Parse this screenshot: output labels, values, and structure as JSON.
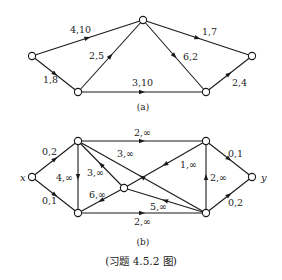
{
  "figure_a": {
    "caption": "(a)",
    "nodes": [
      {
        "id": "a1",
        "x": 32,
        "y": 56
      },
      {
        "id": "a2",
        "x": 78,
        "y": 92
      },
      {
        "id": "a3",
        "x": 143,
        "y": 20
      },
      {
        "id": "a4",
        "x": 206,
        "y": 92
      },
      {
        "id": "a5",
        "x": 252,
        "y": 56
      }
    ],
    "edges": [
      {
        "from": "a1",
        "to": "a3",
        "label": "4,10",
        "lx": 70,
        "ly": 33
      },
      {
        "from": "a1",
        "to": "a2",
        "label": "1,8",
        "lx": 43,
        "ly": 83
      },
      {
        "from": "a2",
        "to": "a3",
        "label": "2,5",
        "lx": 89,
        "ly": 59
      },
      {
        "from": "a2",
        "to": "a4",
        "label": "3,10",
        "lx": 132,
        "ly": 86
      },
      {
        "from": "a3",
        "to": "a4",
        "label": "6,2",
        "lx": 183,
        "ly": 60
      },
      {
        "from": "a3",
        "to": "a5",
        "label": "1,7",
        "lx": 202,
        "ly": 35
      },
      {
        "from": "a4",
        "to": "a5",
        "label": "2,4",
        "lx": 232,
        "ly": 86
      }
    ]
  },
  "figure_b": {
    "caption": "(b)",
    "nodes": [
      {
        "id": "x",
        "x": 32,
        "y": 177,
        "name": "x",
        "nx": 20,
        "ny": 181
      },
      {
        "id": "tl",
        "x": 78,
        "y": 141
      },
      {
        "id": "bl",
        "x": 78,
        "y": 213
      },
      {
        "id": "c",
        "x": 124,
        "y": 188
      },
      {
        "id": "tr",
        "x": 206,
        "y": 141
      },
      {
        "id": "br",
        "x": 206,
        "y": 213
      },
      {
        "id": "y",
        "x": 252,
        "y": 177,
        "name": "y",
        "nx": 261,
        "ny": 181
      }
    ],
    "edges": [
      {
        "from": "x",
        "to": "tl",
        "label": "0,2",
        "lx": 42,
        "ly": 155
      },
      {
        "from": "x",
        "to": "bl",
        "label": "0,1",
        "lx": 42,
        "ly": 204
      },
      {
        "from": "tl",
        "to": "tr",
        "label": "2,∞",
        "lx": 134,
        "ly": 136
      },
      {
        "from": "tl",
        "to": "bl",
        "label": "4,∞",
        "lx": 56,
        "ly": 181
      },
      {
        "from": "c",
        "to": "tl",
        "label": "3,∞",
        "lx": 87,
        "ly": 176
      },
      {
        "from": "br",
        "to": "tl",
        "label": "3,∞",
        "lx": 117,
        "ly": 157
      },
      {
        "from": "tr",
        "to": "c",
        "label": "1,∞",
        "lx": 180,
        "ly": 168
      },
      {
        "from": "c",
        "to": "bl",
        "label": "6,∞",
        "lx": 89,
        "ly": 198
      },
      {
        "from": "br",
        "to": "c",
        "label": "5,∞",
        "lx": 150,
        "ly": 210
      },
      {
        "from": "bl",
        "to": "br",
        "label": "2,∞",
        "lx": 134,
        "ly": 225
      },
      {
        "from": "br",
        "to": "tr",
        "label": "2,∞",
        "lx": 210,
        "ly": 181
      },
      {
        "from": "tr",
        "to": "y",
        "label": "0,1",
        "lx": 228,
        "ly": 157
      },
      {
        "from": "br",
        "to": "y",
        "label": "0,2",
        "lx": 228,
        "ly": 206
      }
    ]
  },
  "title_caption": "(习题 4.5.2 图)"
}
